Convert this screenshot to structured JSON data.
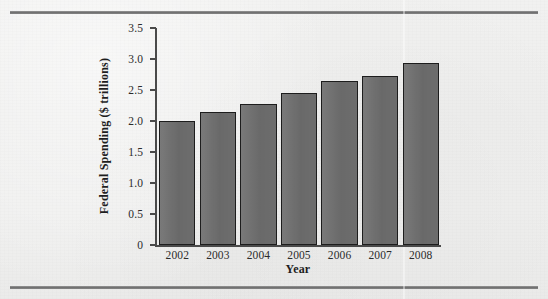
{
  "figure": {
    "background_color": "#efefee",
    "rule_color": "#6f6f6f",
    "bar_fill_color": "#6f6f6f",
    "bar_outline_color": "#1d1d1d",
    "axis_color": "#4a4a4a"
  },
  "chart_data": {
    "type": "bar",
    "title": "",
    "xlabel": "Year",
    "ylabel": "Federal Spending ($ trillions)",
    "categories": [
      "2002",
      "2003",
      "2004",
      "2005",
      "2006",
      "2007",
      "2008"
    ],
    "values": [
      2.0,
      2.14,
      2.27,
      2.45,
      2.64,
      2.72,
      2.93
    ],
    "ylim": [
      0,
      3.5
    ],
    "xlim_categories": 7,
    "ytick_labels": [
      "0",
      "0.5",
      "1.0",
      "1.5",
      "2.0",
      "2.5",
      "3.0",
      "3.5"
    ],
    "ytick_values": [
      0,
      0.5,
      1.0,
      1.5,
      2.0,
      2.5,
      3.0,
      3.5
    ],
    "grid": false,
    "legend": null,
    "legend_position": "none",
    "series": [
      {
        "name": "Federal Spending",
        "values": [
          2.0,
          2.14,
          2.27,
          2.45,
          2.64,
          2.72,
          2.93
        ]
      }
    ],
    "annotations": []
  }
}
